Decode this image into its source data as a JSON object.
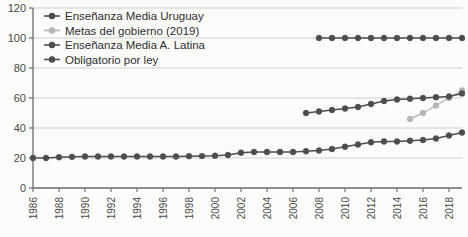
{
  "chart_data": {
    "type": "line",
    "title": "",
    "subtitle": "",
    "xlabel": "",
    "ylabel": "",
    "xlim": [
      1986,
      2019
    ],
    "ylim": [
      0,
      120
    ],
    "grid": true,
    "grid_axis": "y",
    "legend_position": "top-left-inside",
    "y_ticks": [
      "0",
      "20",
      "40",
      "60",
      "80",
      "100",
      "120"
    ],
    "y_tick_values": [
      0,
      20,
      40,
      60,
      80,
      100,
      120
    ],
    "x_ticks": [
      "1986",
      "1988",
      "1990",
      "1992",
      "1994",
      "1996",
      "1998",
      "2000",
      "2002",
      "2004",
      "2006",
      "2008",
      "2010",
      "2012",
      "2014",
      "2016",
      "2018"
    ],
    "x_tick_values": [
      1986,
      1988,
      1990,
      1992,
      1994,
      1996,
      1998,
      2000,
      2002,
      2004,
      2006,
      2008,
      2010,
      2012,
      2014,
      2016,
      2018
    ],
    "x_tick_rotation": -90,
    "series": [
      {
        "name": "Enseñanza Media Uruguay",
        "color": "#4d4d4d",
        "marker": "circle",
        "x": [
          1986,
          1987,
          1988,
          1989,
          1990,
          1991,
          1992,
          1993,
          1994,
          1995,
          1996,
          1997,
          1998,
          1999,
          2000,
          2001,
          2002,
          2003,
          2004,
          2005,
          2006,
          2007,
          2008,
          2009,
          2010,
          2011,
          2012,
          2013,
          2014,
          2015,
          2016,
          2017,
          2018,
          2019
        ],
        "values": [
          20,
          20,
          20.5,
          20.8,
          21,
          21,
          21,
          21,
          21,
          21,
          21,
          21,
          21.2,
          21.3,
          21.5,
          22,
          23.5,
          24,
          24,
          24,
          24,
          24.5,
          25,
          26,
          27.5,
          29,
          30.5,
          31,
          31,
          31.5,
          32,
          33,
          35,
          37
        ]
      },
      {
        "name": "Metas del gobierno (2019)",
        "color": "#b5b5b5",
        "marker": "circle",
        "x": [
          2015,
          2016,
          2017,
          2018,
          2019
        ],
        "values": [
          46,
          50,
          55,
          60,
          65
        ]
      },
      {
        "name": "Enseñanza Media A. Latina",
        "color": "#4d4d4d",
        "marker": "circle",
        "x": [
          2007,
          2008,
          2009,
          2010,
          2011,
          2012,
          2013,
          2014,
          2015,
          2016,
          2017,
          2018,
          2019
        ],
        "values": [
          50,
          51,
          52,
          53,
          54,
          56,
          58,
          59,
          59.5,
          60,
          60.5,
          61,
          63
        ]
      },
      {
        "name": "Obligatorio por ley",
        "color": "#4d4d4d",
        "marker": "circle",
        "x": [
          2008,
          2009,
          2010,
          2011,
          2012,
          2013,
          2014,
          2015,
          2016,
          2017,
          2018,
          2019
        ],
        "values": [
          100,
          100,
          100,
          100,
          100,
          100,
          100,
          100,
          100,
          100,
          100,
          100
        ]
      }
    ],
    "legend": [
      {
        "label": "Enseñanza Media Uruguay",
        "color": "#4d4d4d"
      },
      {
        "label": "Metas del gobierno (2019)",
        "color": "#b5b5b5"
      },
      {
        "label": "Enseñanza Media A. Latina",
        "color": "#4d4d4d"
      },
      {
        "label": "Obligatorio por ley",
        "color": "#4d4d4d"
      }
    ],
    "colors": {
      "axis": "#6b6b6b",
      "grid": "#c9c9c9",
      "text": "#3a3a3a",
      "background": "#fbfbf9",
      "series_dark": "#4d4d4d",
      "series_light": "#b5b5b5"
    }
  }
}
